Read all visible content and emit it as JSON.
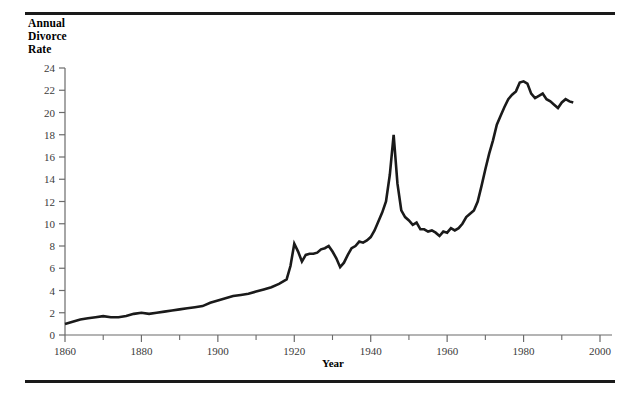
{
  "figure": {
    "ylabel_lines": "Annual\nDivorce\nRate",
    "xlabel": "Year"
  },
  "chart_data": {
    "type": "line",
    "title": "",
    "ylabel": "Annual Divorce Rate",
    "xlabel": "Year",
    "xlim": [
      1860,
      2000
    ],
    "ylim": [
      0,
      24
    ],
    "ytick_step": 2,
    "yticks": [
      0,
      2,
      4,
      6,
      8,
      10,
      12,
      14,
      16,
      18,
      20,
      22,
      24
    ],
    "ytick_labels": [
      "0",
      "2",
      "4",
      "6",
      "8",
      "10",
      "12",
      "14",
      "16",
      "18",
      "20",
      "22",
      "24"
    ],
    "xticks": [
      1860,
      1880,
      1900,
      1920,
      1940,
      1960,
      1980,
      2000
    ],
    "xtick_labels": [
      "1860",
      "1880",
      "1900",
      "1920",
      "1940",
      "1960",
      "1980",
      "2000"
    ],
    "xminor_ticks": [
      1870,
      1890,
      1910,
      1930,
      1950,
      1970,
      1990
    ],
    "grid": false,
    "legend": "none",
    "line_color": "#1a1a1a",
    "line_width": 2.6,
    "series": [
      {
        "name": "Annual Divorce Rate",
        "x": [
          1860,
          1862,
          1864,
          1866,
          1868,
          1870,
          1872,
          1874,
          1876,
          1878,
          1880,
          1882,
          1884,
          1886,
          1888,
          1890,
          1892,
          1894,
          1896,
          1898,
          1900,
          1902,
          1904,
          1906,
          1908,
          1910,
          1912,
          1914,
          1916,
          1918,
          1919,
          1920,
          1921,
          1922,
          1923,
          1924,
          1925,
          1926,
          1927,
          1928,
          1929,
          1930,
          1931,
          1932,
          1933,
          1934,
          1935,
          1936,
          1937,
          1938,
          1939,
          1940,
          1941,
          1942,
          1943,
          1944,
          1945,
          1946,
          1947,
          1948,
          1949,
          1950,
          1951,
          1952,
          1953,
          1954,
          1955,
          1956,
          1957,
          1958,
          1959,
          1960,
          1961,
          1962,
          1963,
          1964,
          1965,
          1966,
          1967,
          1968,
          1969,
          1970,
          1971,
          1972,
          1973,
          1974,
          1975,
          1976,
          1977,
          1978,
          1979,
          1980,
          1981,
          1982,
          1983,
          1984,
          1985,
          1986,
          1987,
          1988,
          1989,
          1990,
          1991,
          1992,
          1993
        ],
        "y": [
          1.0,
          1.2,
          1.4,
          1.5,
          1.6,
          1.7,
          1.6,
          1.6,
          1.7,
          1.9,
          2.0,
          1.9,
          2.0,
          2.1,
          2.2,
          2.3,
          2.4,
          2.5,
          2.6,
          2.9,
          3.1,
          3.3,
          3.5,
          3.6,
          3.7,
          3.9,
          4.1,
          4.3,
          4.6,
          5.0,
          6.2,
          8.2,
          7.5,
          6.6,
          7.2,
          7.3,
          7.3,
          7.4,
          7.7,
          7.8,
          8.0,
          7.5,
          6.9,
          6.1,
          6.5,
          7.2,
          7.8,
          8.0,
          8.4,
          8.3,
          8.5,
          8.8,
          9.4,
          10.2,
          11.0,
          12.0,
          14.4,
          18.0,
          13.6,
          11.2,
          10.6,
          10.3,
          9.9,
          10.1,
          9.5,
          9.5,
          9.3,
          9.4,
          9.2,
          8.9,
          9.3,
          9.2,
          9.6,
          9.4,
          9.6,
          10.0,
          10.6,
          10.9,
          11.2,
          12.0,
          13.4,
          14.9,
          16.3,
          17.5,
          18.9,
          19.7,
          20.5,
          21.2,
          21.6,
          21.9,
          22.7,
          22.8,
          22.6,
          21.7,
          21.3,
          21.5,
          21.7,
          21.2,
          21.0,
          20.7,
          20.4,
          20.9,
          21.2,
          21.0,
          20.9
        ]
      }
    ]
  }
}
